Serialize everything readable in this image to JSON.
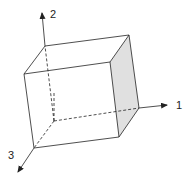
{
  "diagram": {
    "axes": [
      {
        "label": "1",
        "direction": "right"
      },
      {
        "label": "2",
        "direction": "up"
      },
      {
        "label": "3",
        "direction": "down-left"
      }
    ],
    "shaded_face": "right face (normal to axis 1)",
    "colors": {
      "line": "#222222",
      "shade": "#e0e0e0"
    }
  }
}
